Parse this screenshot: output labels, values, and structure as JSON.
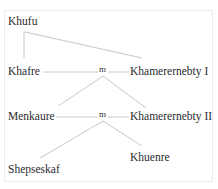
{
  "diagram": {
    "type": "family-tree",
    "style": {
      "line_color": "#c8c8c8",
      "text_color": "#2b2b2b",
      "frame_color": "#ececec"
    },
    "people": [
      {
        "id": "khufu",
        "name": "Khufu"
      },
      {
        "id": "khafre",
        "name": "Khafre"
      },
      {
        "id": "khamerernebty1",
        "name": "Khamerernebty I"
      },
      {
        "id": "menkaure",
        "name": "Menkaure"
      },
      {
        "id": "khamerernebty2",
        "name": "Khamerernebty II"
      },
      {
        "id": "shepseskaf",
        "name": "Shepseskaf"
      },
      {
        "id": "khuenre",
        "name": "Khuenre"
      }
    ],
    "marriages": [
      {
        "label": "m",
        "spouses": [
          "khafre",
          "khamerernebty1"
        ],
        "children": [
          "menkaure",
          "khamerernebty2"
        ]
      },
      {
        "label": "m",
        "spouses": [
          "menkaure",
          "khamerernebty2"
        ],
        "children": [
          "shepseskaf",
          "khuenre"
        ]
      }
    ],
    "parent_links": [
      {
        "from": "khufu",
        "to": "khafre"
      },
      {
        "from": "khufu",
        "to": "khamerernebty1"
      }
    ]
  }
}
